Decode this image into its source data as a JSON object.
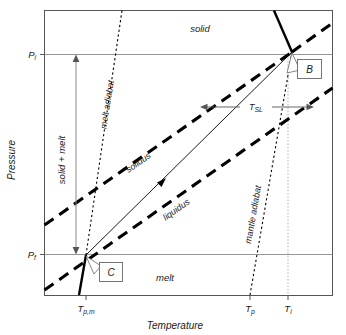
{
  "figure": {
    "type": "phase-diagram",
    "axes": {
      "x_label": "Temperature",
      "y_label": "Pressure",
      "x_ticks": [
        {
          "id": "Tpm",
          "base": "T",
          "sub": "p,m",
          "x_frac": 0.145
        },
        {
          "id": "Tp",
          "base": "T",
          "sub": "p",
          "x_frac": 0.715
        },
        {
          "id": "Ti",
          "base": "T",
          "sub": "i",
          "x_frac": 0.845
        }
      ],
      "y_ticks": [
        {
          "id": "Pi",
          "base": "P",
          "sub": "i",
          "y_frac": 0.155
        },
        {
          "id": "Pf",
          "base": "P",
          "sub": "f",
          "y_frac": 0.855
        }
      ]
    },
    "regions": [
      {
        "id": "solid-region",
        "label": "solid"
      },
      {
        "id": "solid-plus-melt-region",
        "label": "solid + melt"
      },
      {
        "id": "melt-region",
        "label": "melt"
      }
    ],
    "curves": [
      {
        "id": "solidus",
        "label": "solidus",
        "style": "thick-dashed"
      },
      {
        "id": "liquidus",
        "label": "liquidus",
        "style": "thick-dashed"
      },
      {
        "id": "melt-adiabat",
        "label": "melt adiabat",
        "style": "fine-dotted"
      },
      {
        "id": "mantle-adiabat",
        "label": "mantle adiabat",
        "style": "fine-dotted"
      },
      {
        "id": "decompression-path",
        "label": "",
        "style": "thin-solid-arrow"
      }
    ],
    "annotations": [
      {
        "id": "Tsl",
        "base": "T",
        "sub": "SL",
        "kind": "double-arrow-measure"
      },
      {
        "id": "point-B",
        "label": "B",
        "kind": "callout-box"
      },
      {
        "id": "point-C",
        "label": "C",
        "kind": "callout-box"
      }
    ],
    "colors": {
      "line": "#000000",
      "frame": "#555555",
      "guide": "#8a8a8a",
      "text": "#1a1a1a",
      "background": "#ffffff"
    }
  }
}
